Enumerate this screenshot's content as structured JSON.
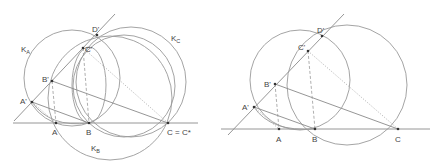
{
  "figures": [
    {
      "id": "left",
      "points": [
        {
          "name": "A",
          "label": "A"
        },
        {
          "name": "B",
          "label": "B"
        },
        {
          "name": "C",
          "label": "C = C*"
        },
        {
          "name": "A_prime",
          "label": "A'"
        },
        {
          "name": "B_prime",
          "label": "B'"
        },
        {
          "name": "C_prime",
          "label": "C'"
        },
        {
          "name": "D_prime",
          "label": "D'"
        }
      ],
      "circles": [
        {
          "name": "K_A",
          "label": "K",
          "sub": "A"
        },
        {
          "name": "K_B",
          "label": "K",
          "sub": "B"
        },
        {
          "name": "K_C",
          "label": "K",
          "sub": "C"
        }
      ]
    },
    {
      "id": "right",
      "points": [
        {
          "name": "A",
          "label": "A"
        },
        {
          "name": "B",
          "label": "B"
        },
        {
          "name": "C",
          "label": "C"
        },
        {
          "name": "A_prime",
          "label": "A'"
        },
        {
          "name": "B_prime",
          "label": "B'"
        },
        {
          "name": "C_prime",
          "label": "C'"
        },
        {
          "name": "D_prime",
          "label": "D'"
        }
      ]
    }
  ]
}
